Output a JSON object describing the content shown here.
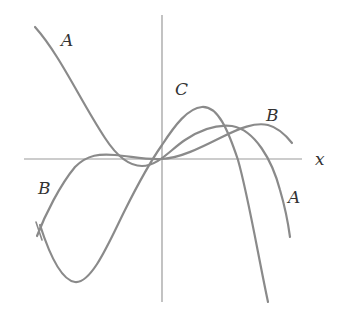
{
  "figure": {
    "axis_label_x": "x",
    "labels": {
      "A_top": "A",
      "A_right": "A",
      "B_right": "B",
      "B_left": "B",
      "C_top": "C"
    },
    "colors": {
      "curve": "#8a8a8a",
      "axis": "#9a9a9a",
      "text": "#333333",
      "background": "#ffffff"
    }
  }
}
